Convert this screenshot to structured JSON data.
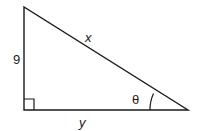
{
  "diagram": {
    "type": "right-triangle",
    "labels": {
      "vertical_side": "9",
      "hypotenuse": "x",
      "horizontal_side": "y",
      "angle": "θ"
    },
    "stroke_color": "#1a1a1a",
    "background": "#ffffff"
  }
}
